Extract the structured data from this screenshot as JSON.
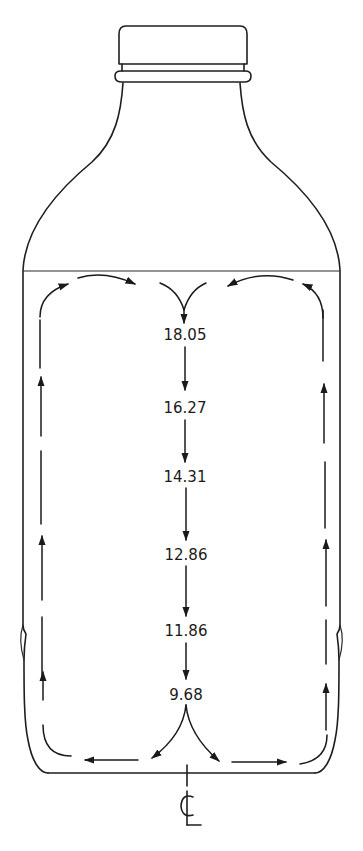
{
  "diagram": {
    "centerline_symbol": "CL",
    "values_top_to_bottom": [
      "18.05",
      "16.27",
      "14.31",
      "12.86",
      "11.86",
      "9.68"
    ],
    "colors": {
      "ink": "#1a1a1a",
      "background": "#ffffff"
    }
  }
}
